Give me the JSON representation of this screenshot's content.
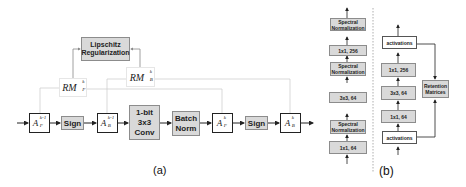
{
  "panel_a": {
    "caption": "(a)",
    "regularizer": {
      "line1": "Lipschitz",
      "line2": "Regularization"
    },
    "rm_f": {
      "base": "RM",
      "sup": "k",
      "sub": "F"
    },
    "rm_b": {
      "base": "RM",
      "sup": "k",
      "sub": "B"
    },
    "pipeline": [
      {
        "id": "a_f_prev",
        "base": "A",
        "sup": "k-1",
        "sub": "F"
      },
      {
        "id": "sign1",
        "label": "Sign"
      },
      {
        "id": "a_b_prev",
        "base": "A",
        "sup": "k-1",
        "sub": "B"
      },
      {
        "id": "conv",
        "line1": "1-bit",
        "line2": "3x3",
        "line3": "Conv"
      },
      {
        "id": "bn",
        "line1": "Batch",
        "line2": "Norm"
      },
      {
        "id": "a_f",
        "base": "A",
        "sup": "k",
        "sub": "F"
      },
      {
        "id": "sign2",
        "label": "Sign"
      },
      {
        "id": "a_b",
        "base": "A",
        "sup": "k",
        "sub": "B"
      }
    ]
  },
  "panel_b": {
    "caption": "(b)",
    "left_column": [
      {
        "label": "Spectral Normalization",
        "line1": "Spectral",
        "line2": "Normalization"
      },
      {
        "label": "1x1, 256"
      },
      {
        "label": "Spectral Normalization",
        "line1": "Spectral",
        "line2": "Normalization"
      },
      {
        "label": "3x3, 64"
      },
      {
        "label": "Spectral Normalization",
        "line1": "Spectral",
        "line2": "Normalization"
      },
      {
        "label": "1x1, 64"
      }
    ],
    "right_column": {
      "top_activations": "activations",
      "conv_256": "1x1, 256",
      "conv_3x3": "3x3, 64",
      "conv_64": "1x1, 64",
      "bottom_activations": "activations",
      "retention": {
        "line1": "Retention",
        "line2": "Matrices"
      }
    }
  },
  "colors": {
    "gray_fill": "#d9d9d9",
    "gray_border": "#8c8c8c",
    "arrow": "#222222",
    "thin_line": "#cfcfcf"
  }
}
